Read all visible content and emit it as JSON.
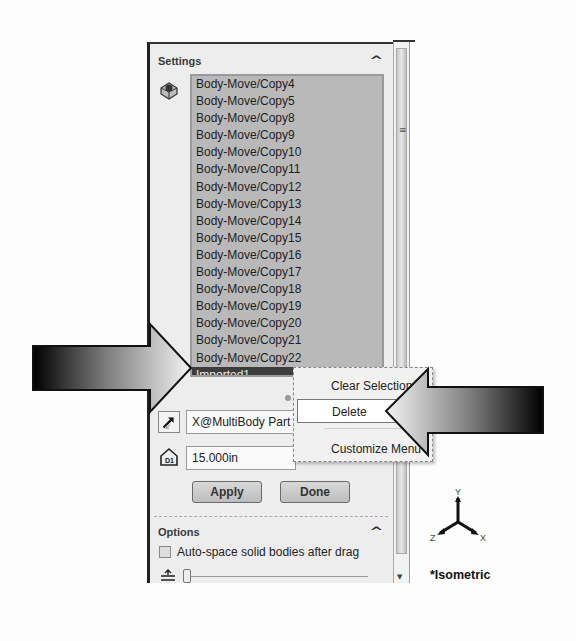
{
  "settings": {
    "title": "Settings",
    "collapse_icon": "chevron-up-icon",
    "bodies_icon": "solid-bodies-icon",
    "bodies": [
      "Body-Move/Copy4",
      "Body-Move/Copy5",
      "Body-Move/Copy8",
      "Body-Move/Copy9",
      "Body-Move/Copy10",
      "Body-Move/Copy11",
      "Body-Move/Copy12",
      "Body-Move/Copy13",
      "Body-Move/Copy14",
      "Body-Move/Copy15",
      "Body-Move/Copy16",
      "Body-Move/Copy17",
      "Body-Move/Copy18",
      "Body-Move/Copy19",
      "Body-Move/Copy20",
      "Body-Move/Copy21",
      "Body-Move/Copy22",
      "Imported1"
    ],
    "selected_body": "Imported1",
    "direction_reference": "X@MultiBody Part",
    "distance": "15.000in",
    "apply_label": "Apply",
    "done_label": "Done"
  },
  "options": {
    "title": "Options",
    "auto_space_label": "Auto-space solid bodies after drag",
    "auto_space_checked": false,
    "slider_value": 0
  },
  "context_menu": {
    "items": [
      {
        "label": "Clear Selections"
      },
      {
        "label": "Delete",
        "highlighted": true
      },
      {
        "label": "Customize Menu"
      }
    ]
  },
  "view": {
    "triad_axes": [
      "Y",
      "Z",
      "X"
    ],
    "orientation_label": "*Isometric"
  },
  "annotations": {
    "left_arrow": "callout-arrow pointing right at Imported1",
    "right_arrow": "callout-arrow pointing left at Delete"
  }
}
